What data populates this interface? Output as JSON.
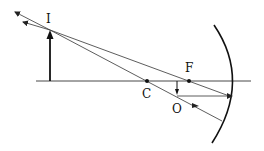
{
  "diagram": {
    "labels": {
      "image": "I",
      "center": "C",
      "focus": "F",
      "object": "O"
    },
    "colors": {
      "ink": "#1a1a1a",
      "ray": "#333333",
      "background": "#ffffff"
    }
  }
}
